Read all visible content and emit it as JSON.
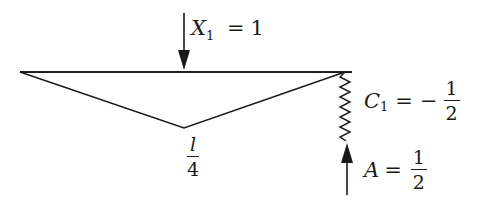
{
  "diagram": {
    "colors": {
      "stroke": "#1a1a1a",
      "background": "#ffffff"
    },
    "labels": {
      "load": {
        "symbol": "X",
        "subscript": "1",
        "equals": "=",
        "value": "1"
      },
      "apex": {
        "numerator": "l",
        "denominator": "4"
      },
      "spring": {
        "symbol": "C",
        "subscript": "1",
        "equals": "=",
        "sign": "−",
        "numerator": "1",
        "denominator": "2"
      },
      "reaction": {
        "symbol": "A",
        "equals": "=",
        "numerator": "1",
        "denominator": "2"
      }
    },
    "elements": {
      "beam": "horizontal-beam",
      "influence": "triangular-influence-line",
      "spring_support": "spring-support",
      "load_arrow": "downward-arrow",
      "reaction_arrow": "upward-arrow"
    }
  }
}
